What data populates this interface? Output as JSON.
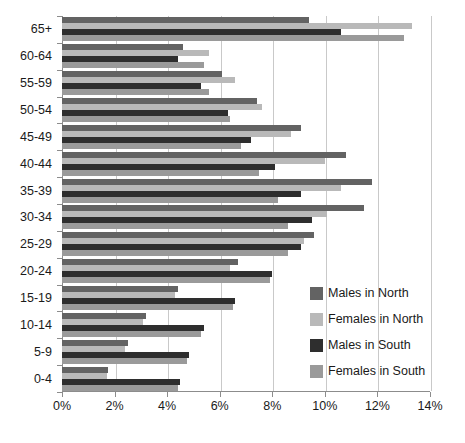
{
  "chart_data": {
    "type": "bar",
    "orientation": "horizontal",
    "title": "",
    "subtitle": "",
    "xlabel": "",
    "ylabel": "",
    "xlim": [
      0,
      14
    ],
    "ylim": null,
    "grid": true,
    "grid_axis": "x",
    "legend_position": "inside-right",
    "categories": [
      "65+",
      "60-64",
      "55-59",
      "50-54",
      "45-49",
      "40-44",
      "35-39",
      "30-34",
      "25-29",
      "20-24",
      "15-19",
      "10-14",
      "5-9",
      "0-4"
    ],
    "xticks": [
      0,
      2,
      4,
      6,
      8,
      10,
      12,
      14
    ],
    "xticklabels": [
      "0%",
      "2%",
      "4%",
      "6%",
      "8%",
      "10%",
      "12%",
      "14%"
    ],
    "series": [
      {
        "name": "Males in North",
        "color": "#636363",
        "values": [
          9.4,
          4.6,
          6.1,
          7.4,
          9.1,
          10.8,
          11.8,
          11.5,
          9.6,
          6.7,
          4.4,
          3.2,
          2.5,
          1.75
        ]
      },
      {
        "name": "Females in North",
        "color": "#b9b9b9",
        "values": [
          13.3,
          5.6,
          6.6,
          7.6,
          8.7,
          10.0,
          10.6,
          10.1,
          9.2,
          6.4,
          4.3,
          3.1,
          2.4,
          1.7
        ]
      },
      {
        "name": "Males in South",
        "color": "#2e2e2e",
        "values": [
          10.6,
          4.4,
          5.3,
          6.3,
          7.2,
          8.1,
          9.1,
          9.5,
          9.1,
          8.0,
          6.6,
          5.4,
          4.85,
          4.5
        ]
      },
      {
        "name": "Females in South",
        "color": "#9a9a9a",
        "values": [
          13.0,
          5.4,
          5.6,
          6.4,
          6.8,
          7.5,
          8.2,
          8.6,
          8.6,
          7.9,
          6.5,
          5.3,
          4.75,
          4.4
        ]
      }
    ]
  },
  "legend": {
    "items": [
      {
        "label": "Males in North",
        "color": "#636363"
      },
      {
        "label": "Females in North",
        "color": "#b9b9b9"
      },
      {
        "label": "Males in South",
        "color": "#2e2e2e"
      },
      {
        "label": "Females in South",
        "color": "#9a9a9a"
      }
    ]
  }
}
